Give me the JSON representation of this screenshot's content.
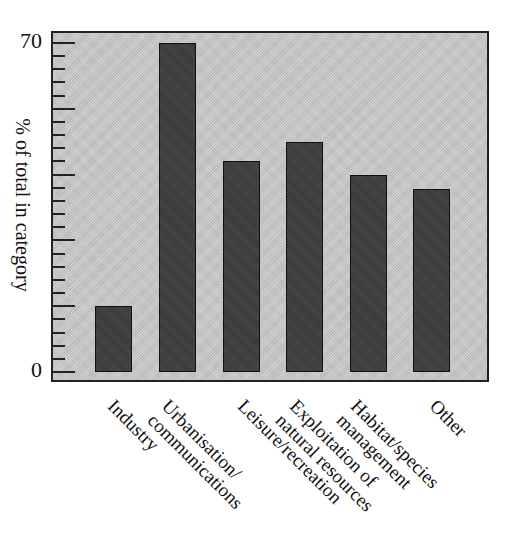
{
  "title_fragment": "Fig",
  "chart_data": {
    "type": "bar",
    "title": "",
    "xlabel": "",
    "ylabel": "% of total in category",
    "categories": [
      "Industry",
      "Urbanisation/\ncommunications",
      "Leisure/recreation",
      "Exploitation of\nnatural resources",
      "Habitat/species\nmanagement",
      "Other"
    ],
    "values": [
      14,
      70,
      45,
      49,
      42,
      39
    ],
    "ylim": [
      0,
      70
    ],
    "y_tick_labels": [
      "0",
      "70"
    ],
    "major_tick_step": 14,
    "minor_ticks_per_major": 5,
    "grid": false,
    "legend": null,
    "colors": {
      "plot_background": "#c9c9c9",
      "bar_fill": "#3a3a3a",
      "frame": "#222222"
    }
  }
}
